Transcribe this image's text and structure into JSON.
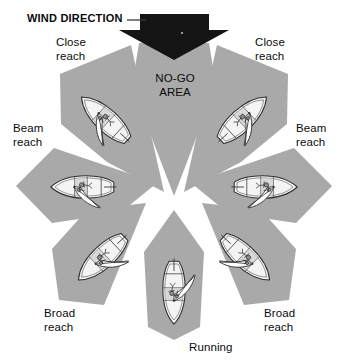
{
  "diagram": {
    "background_color": "#ffffff",
    "sector_fill": "#a9a9a9",
    "arrow_color": "#141414",
    "hull_fill": "#f2f2f2",
    "outline_color": "#2b2b2b",
    "text_color": "#0b0b0b"
  },
  "labels": {
    "wind_direction": "WIND DIRECTION",
    "no_go_area": "NO-GO\nAREA",
    "no_go_area_line1": "NO-GO",
    "no_go_area_line2": "AREA",
    "close_reach_left": "Close\nreach",
    "close_reach_right": "Close\nreach",
    "beam_reach_left": "Beam\nreach",
    "beam_reach_right": "Beam\nreach",
    "broad_reach_left": "Broad\nreach",
    "broad_reach_right": "Broad\nreach",
    "running": "Running"
  },
  "sectors": [
    {
      "id": "no-go-area",
      "name": "no-go-area",
      "label": "NO-GO AREA",
      "angle_deg": 0,
      "has_boat": false
    },
    {
      "id": "close-reach-left",
      "name": "close-reach-port",
      "label": "Close reach",
      "angle_deg": -45,
      "has_boat": true
    },
    {
      "id": "close-reach-right",
      "name": "close-reach-stbd",
      "label": "Close reach",
      "angle_deg": 45,
      "has_boat": true
    },
    {
      "id": "beam-reach-left",
      "name": "beam-reach-port",
      "label": "Beam reach",
      "angle_deg": -90,
      "has_boat": true
    },
    {
      "id": "beam-reach-right",
      "name": "beam-reach-stbd",
      "label": "Beam reach",
      "angle_deg": 90,
      "has_boat": true
    },
    {
      "id": "broad-reach-left",
      "name": "broad-reach-port",
      "label": "Broad reach",
      "angle_deg": -135,
      "has_boat": true
    },
    {
      "id": "broad-reach-right",
      "name": "broad-reach-stbd",
      "label": "Broad reach",
      "angle_deg": 135,
      "has_boat": true
    },
    {
      "id": "running",
      "name": "running",
      "label": "Running",
      "angle_deg": 180,
      "has_boat": true
    }
  ],
  "icons": {
    "wind_arrow": "down-arrow-icon",
    "leader_line": "leader-line-icon",
    "boat": "sailboat-icon"
  }
}
